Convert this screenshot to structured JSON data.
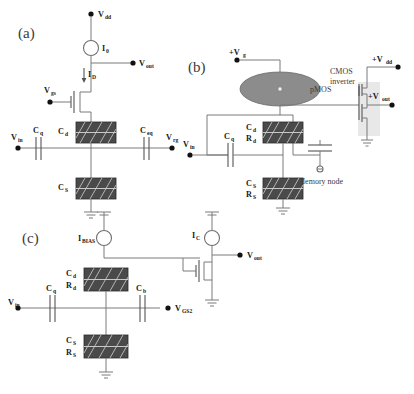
{
  "figure": {
    "background_color": "#ffffff",
    "wire_color": "#7a7a7a",
    "block_fill": "#4a4a4a",
    "ellipse_fill": "#8c8c8c"
  },
  "panels": {
    "a": {
      "tag": "(a)",
      "labels": {
        "vdd": "V",
        "vdd_sub": "dd",
        "i0": "I",
        "i0_sub": "0",
        "vout": "V",
        "vout_sub": "out",
        "id": "I",
        "id_sub": "D",
        "vgs": "V",
        "vgs_sub": "gs",
        "cd": "C",
        "cd_sub": "d",
        "cs": "C",
        "cs_sub": "S",
        "cq": "C",
        "cq_sub": "q",
        "ceq": "C",
        "ceq_sub": "eq",
        "vin": "V",
        "vin_sub": "in",
        "vrg": "V",
        "vrg_sub": "rg"
      }
    },
    "b": {
      "tag": "(b)",
      "labels": {
        "vg": "+V",
        "vg_sub": "g",
        "pmos": "pMOS",
        "cmos_inverter_line1": "CMOS",
        "cmos_inverter_line2": "inverter",
        "vdd": "+V",
        "vdd_sub": "dd",
        "vout": "+V",
        "vout_sub": "out",
        "cd": "C",
        "cd_sub": "d",
        "rd": "R",
        "rd_sub": "d",
        "cs": "C",
        "cs_sub": "S",
        "rs": "R",
        "rs_sub": "S",
        "cq": "C",
        "cq_sub": "q",
        "vin": "V",
        "vin_sub": "in",
        "memory_node": "Memory node"
      }
    },
    "c": {
      "tag": "(c)",
      "labels": {
        "ibias": "I",
        "ibias_sub": "BIAS",
        "ic": "I",
        "ic_sub": "C",
        "vout": "V",
        "vout_sub": "out",
        "cd": "C",
        "cd_sub": "d",
        "rd": "R",
        "rd_sub": "d",
        "cs": "C",
        "cs_sub": "S",
        "rs": "R",
        "rs_sub": "S",
        "cq": "C",
        "cq_sub": "q",
        "cb": "C",
        "cb_sub": "b",
        "vin": "V",
        "vin_sub": "in",
        "vgs2": "V",
        "vgs2_sub": "GS2"
      }
    }
  }
}
